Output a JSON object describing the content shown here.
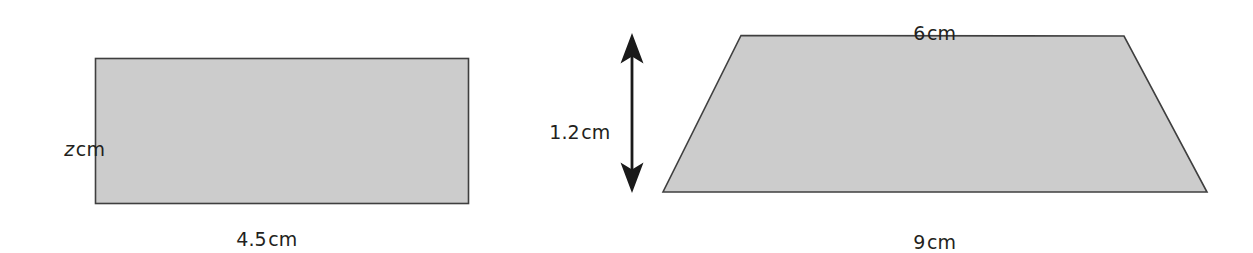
{
  "document": {
    "kind": "geometry-figure-pair",
    "background_color": "#ffffff"
  },
  "style": {
    "shape_fill": "#cccccc",
    "shape_stroke": "#3f3f3f",
    "arrow_color": "#1a1a1a",
    "text_color": "#231f20"
  },
  "figures": [
    {
      "id": "rectangle",
      "name": "rectangle-figure",
      "shape": "rectangle",
      "labels": {
        "height": {
          "value": "z",
          "unit": "cm",
          "italic_variable": true
        },
        "width": {
          "value": "4.5",
          "unit": "cm",
          "italic_variable": false
        }
      }
    },
    {
      "id": "trapezoid",
      "name": "trapezoid-figure",
      "shape": "trapezium",
      "labels": {
        "top": {
          "value": "6",
          "unit": "cm"
        },
        "bottom": {
          "value": "9",
          "unit": "cm"
        },
        "height": {
          "value": "1.2",
          "unit": "cm"
        }
      },
      "height_indicator": "double-headed-vertical-arrow"
    }
  ],
  "labels": {
    "rect_height_var": "z",
    "rect_height_unit": "cm",
    "rect_width_value": "4.5",
    "rect_width_unit": "cm",
    "trap_top_value": "6",
    "trap_top_unit": "cm",
    "trap_bottom_value": "9",
    "trap_bottom_unit": "cm",
    "trap_height_value": "1.2",
    "trap_height_unit": "cm"
  }
}
